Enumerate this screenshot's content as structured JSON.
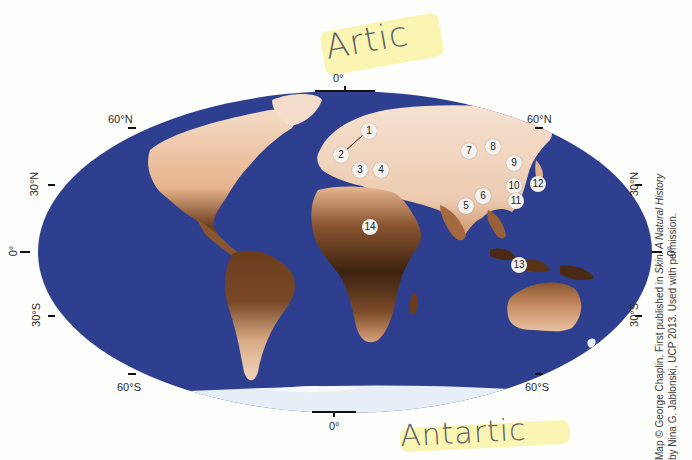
{
  "map": {
    "projection": "Mollweide world map",
    "ocean_color": "#2e3f8f",
    "ice_color": "#e8eef6",
    "skin_color_light": "#f1d2b8",
    "skin_color_dark": "#4a2a14",
    "latitude_labels": {
      "north_60_left": "60°N",
      "north_60_right": "60°N",
      "north_30_left": "30°N",
      "north_30_right": "30°N",
      "equator_left": "0°",
      "equator_right": "0°",
      "south_30_left": "30°S",
      "south_30_right": "30°S",
      "south_60_left": "60°S",
      "south_60_right": "60°S"
    },
    "meridian_labels": {
      "top": "0°",
      "bottom": "0°"
    },
    "markers": [
      {
        "id": "1",
        "label": "1"
      },
      {
        "id": "2",
        "label": "2"
      },
      {
        "id": "3",
        "label": "3"
      },
      {
        "id": "4",
        "label": "4"
      },
      {
        "id": "5",
        "label": "5"
      },
      {
        "id": "6",
        "label": "6"
      },
      {
        "id": "7",
        "label": "7"
      },
      {
        "id": "8",
        "label": "8"
      },
      {
        "id": "9",
        "label": "9"
      },
      {
        "id": "10",
        "label": "10"
      },
      {
        "id": "11",
        "label": "11"
      },
      {
        "id": "12",
        "label": "12"
      },
      {
        "id": "13",
        "label": "13"
      },
      {
        "id": "14",
        "label": "14"
      }
    ]
  },
  "annotations": {
    "top_handwritten": "Artic",
    "bottom_handwritten": "Antartic",
    "highlight_color": "#f7ea7a"
  },
  "credit": {
    "line1_prefix": "Map © George Chaplin. First published in ",
    "line1_italic": "Skin: A Natural History",
    "line2": "by Nina G. Jablonski, UCP 2013. Used with permission."
  }
}
